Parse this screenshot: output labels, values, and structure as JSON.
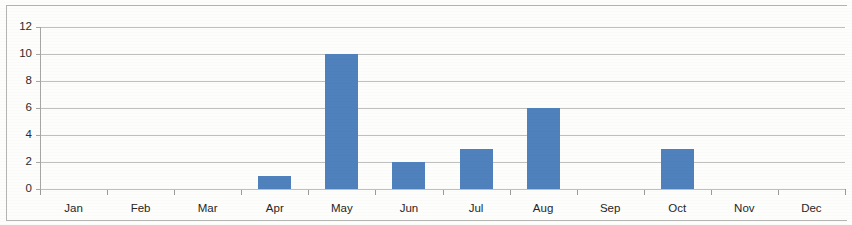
{
  "chart_data": {
    "type": "bar",
    "title": "",
    "subtitle": "",
    "xlabel": "",
    "ylabel": "",
    "categories": [
      "Jan",
      "Feb",
      "Mar",
      "Apr",
      "May",
      "Jun",
      "Jul",
      "Aug",
      "Sep",
      "Oct",
      "Nov",
      "Dec"
    ],
    "values": [
      0,
      0,
      0,
      1,
      10,
      2,
      3,
      6,
      0,
      3,
      0,
      0
    ],
    "series": [
      {
        "name": "",
        "values": [
          0,
          0,
          0,
          1,
          10,
          2,
          3,
          6,
          0,
          3,
          0,
          0
        ]
      }
    ],
    "ylim": [
      0,
      12
    ],
    "y_ticks": [
      0,
      2,
      4,
      6,
      8,
      10,
      12
    ],
    "y_tick_labels": [
      "0",
      "2",
      "4",
      "6",
      "8",
      "10",
      "12"
    ],
    "grid": true,
    "grid_axis": "y",
    "legend": false,
    "legend_position": "none",
    "bar_color": "#4F81BD",
    "gridline_color": "#BFBFBF",
    "axis_color": "#909090",
    "text_color": "#262626",
    "background_color": "#FFFFFF",
    "annotations": []
  }
}
